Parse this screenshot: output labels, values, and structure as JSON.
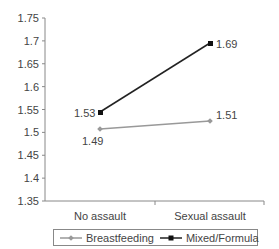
{
  "chart_data": {
    "type": "line",
    "title": "",
    "xlabel": "",
    "ylabel": "",
    "categories": [
      "No assault",
      "Sexual assault"
    ],
    "series": [
      {
        "name": "Breastfeeding",
        "values": [
          1.49,
          1.51
        ],
        "color": "#999999",
        "marker": "diamond"
      },
      {
        "name": "Mixed/Formula",
        "values": [
          1.53,
          1.69
        ],
        "color": "#222222",
        "marker": "square"
      }
    ],
    "ylim": [
      1.35,
      1.75
    ],
    "yticks": [
      "1.75",
      "1.7",
      "1.65",
      "1.6",
      "1.55",
      "1.5",
      "1.45",
      "1.4",
      "1.35"
    ],
    "grid": false,
    "legend_position": "bottom"
  },
  "labels": {
    "cat0": "No assault",
    "cat1": "Sexual assault",
    "bf0": "1.49",
    "bf1": "1.51",
    "mf0": "1.53",
    "mf1": "1.69",
    "legend_bf": "Breastfeeding",
    "legend_mf": "Mixed/Formula"
  }
}
